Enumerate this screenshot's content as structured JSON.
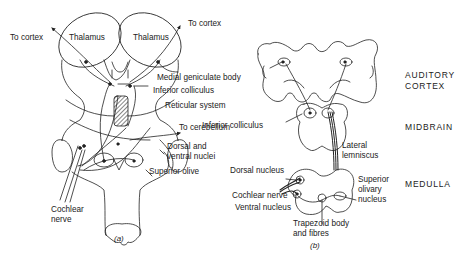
{
  "figure_a": {
    "caption": "(a)",
    "labels": {
      "to_cortex_left": "To cortex",
      "to_cortex_right": "To cortex",
      "thalamus_left": "Thalamus",
      "thalamus_right": "Thalamus",
      "medial_geniculate_body": "Medial geniculate body",
      "inferior_colliculus": "Inferior colliculus",
      "reticular_system": "Reticular system",
      "to_cerebellum": "To cerebellum",
      "dorsal_ventral_nuclei_1": "Dorsal and",
      "dorsal_ventral_nuclei_2": "ventral nuclei",
      "superior_olive": "Superior olive",
      "cochlear_nerve_1": "Cochlear",
      "cochlear_nerve_2": "nerve"
    }
  },
  "figure_b": {
    "caption": "(b)",
    "labels": {
      "inferior_colliculus": "Inferior colliculus",
      "lateral_lemniscus_1": "Lateral",
      "lateral_lemniscus_2": "lemniscus",
      "dorsal_nucleus": "Dorsal nucleus",
      "cochlear_nerve": "Cochlear nerve",
      "ventral_nucleus": "Ventral nucleus",
      "superior_olivary_nucleus_1": "Superior",
      "superior_olivary_nucleus_2": "olivary",
      "superior_olivary_nucleus_3": "nucleus",
      "trapezoid_body_1": "Trapezoid body",
      "trapezoid_body_2": "and fibres"
    },
    "levels": {
      "auditory_cortex_1": "AUDITORY",
      "auditory_cortex_2": "CORTEX",
      "midbrain": "MIDBRAIN",
      "medulla": "MEDULLA"
    }
  }
}
